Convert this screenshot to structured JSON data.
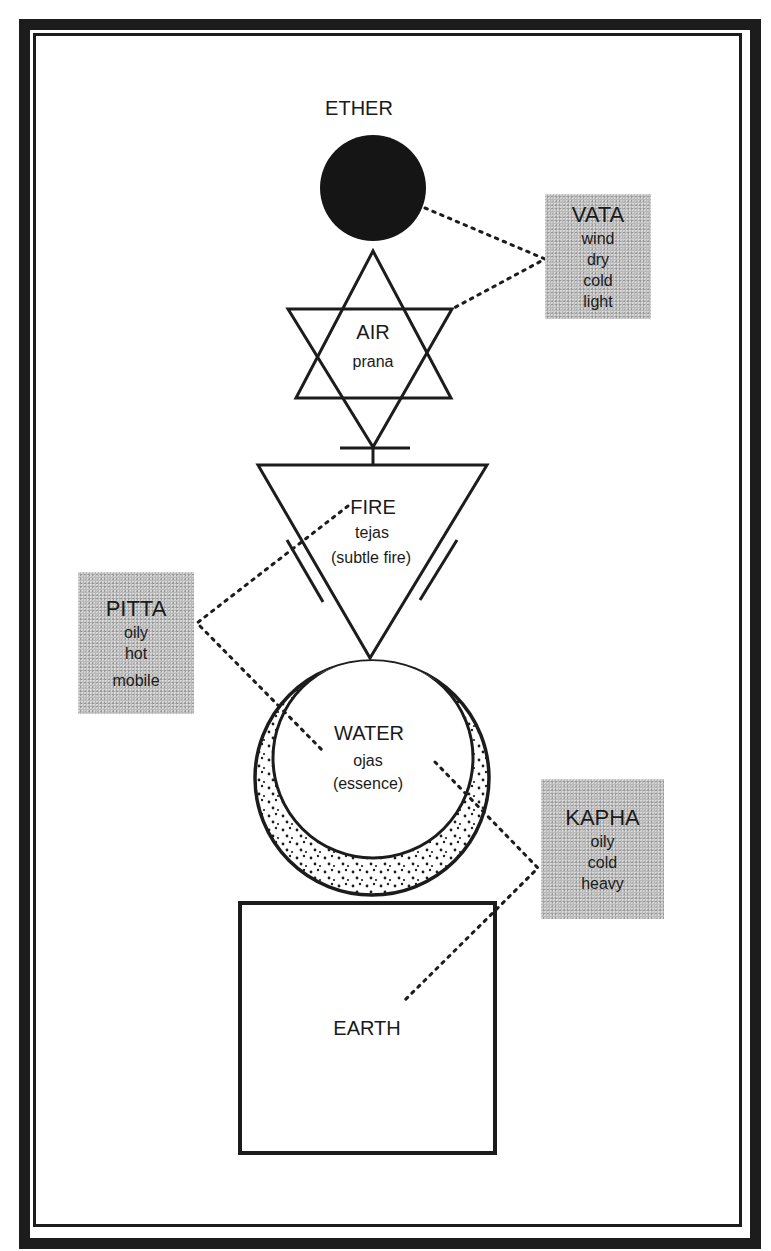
{
  "diagram": {
    "type": "ayurveda-elements-doshas",
    "colors": {
      "ink": "#1c1c1c",
      "dosha_box": "#b9b9b9",
      "background": "#ffffff"
    },
    "elements": [
      {
        "id": "ether",
        "label": "ETHER",
        "shape": "filled-circle"
      },
      {
        "id": "air",
        "label": "AIR",
        "sub": "prana",
        "shape": "hexagram"
      },
      {
        "id": "fire",
        "label": "FIRE",
        "sub": "tejas",
        "sub2": "(subtle fire)",
        "shape": "inverted-triangle"
      },
      {
        "id": "water",
        "label": "WATER",
        "sub": "ojas",
        "sub2": "(essence)",
        "shape": "crescent-circle"
      },
      {
        "id": "earth",
        "label": "EARTH",
        "shape": "square"
      }
    ],
    "doshas": [
      {
        "id": "vata",
        "label": "VATA",
        "qualities": [
          "wind",
          "dry",
          "cold",
          "light"
        ],
        "connects": [
          "ether",
          "air"
        ]
      },
      {
        "id": "pitta",
        "label": "PITTA",
        "qualities": [
          "oily",
          "hot",
          "mobile"
        ],
        "connects": [
          "fire",
          "water"
        ]
      },
      {
        "id": "kapha",
        "label": "KAPHA",
        "qualities": [
          "oily",
          "cold",
          "heavy"
        ],
        "connects": [
          "water",
          "earth"
        ]
      }
    ]
  }
}
